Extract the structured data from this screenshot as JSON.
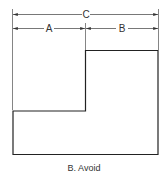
{
  "diagram": {
    "dimensions": [
      {
        "label": "C",
        "from_x": 12,
        "to_x": 158,
        "y": 14
      },
      {
        "label": "A",
        "from_x": 12,
        "to_x": 85,
        "y": 28
      },
      {
        "label": "B",
        "from_x": 85,
        "to_x": 158,
        "y": 28
      }
    ],
    "shape": "stepped outline (L-shape)",
    "caption": "B. Avoid"
  }
}
